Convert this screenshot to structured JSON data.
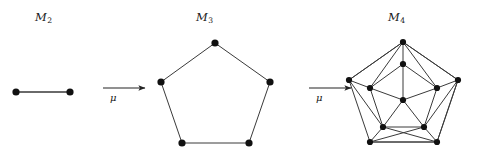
{
  "figure": {
    "background_color": "#ffffff",
    "stroke_color": "#3a3a3a",
    "vertex_color": "#111111",
    "width": 479,
    "height": 161,
    "labels": {
      "m2": {
        "base": "M",
        "sub": "2"
      },
      "m3": {
        "base": "M",
        "sub": "3"
      },
      "m4": {
        "base": "M",
        "sub": "4"
      }
    },
    "arrows": [
      {
        "name": "arrow-1",
        "label": "μ",
        "x1": 103,
        "y1": 88,
        "x2": 145,
        "y2": 88
      },
      {
        "name": "arrow-2",
        "label": "μ",
        "x1": 309,
        "y1": 88,
        "x2": 351,
        "y2": 88
      }
    ],
    "graphs": [
      {
        "id": "m2",
        "label_key": "m2",
        "vertex_count": 2,
        "edge_count": 1,
        "vertices": [
          {
            "id": 0,
            "x": 16,
            "y": 92
          },
          {
            "id": 1,
            "x": 70,
            "y": 92
          }
        ],
        "edges": [
          [
            0,
            1
          ]
        ]
      },
      {
        "id": "m3",
        "label_key": "m3",
        "vertex_count": 5,
        "edge_count": 5,
        "vertices": [
          {
            "id": 0,
            "x": 215,
            "y": 43
          },
          {
            "id": 1,
            "x": 270,
            "y": 82
          },
          {
            "id": 2,
            "x": 249,
            "y": 143
          },
          {
            "id": 3,
            "x": 182,
            "y": 143
          },
          {
            "id": 4,
            "x": 161,
            "y": 82
          }
        ],
        "edges": [
          [
            0,
            1
          ],
          [
            1,
            2
          ],
          [
            2,
            3
          ],
          [
            3,
            4
          ],
          [
            4,
            0
          ]
        ]
      },
      {
        "id": "m4",
        "label_key": "m4",
        "vertex_count": 11,
        "edge_count": 30,
        "vertices": [
          {
            "id": 0,
            "x": 403,
            "y": 42,
            "role": "outer"
          },
          {
            "id": 1,
            "x": 458,
            "y": 80,
            "role": "outer"
          },
          {
            "id": 2,
            "x": 437,
            "y": 142,
            "role": "outer"
          },
          {
            "id": 3,
            "x": 370,
            "y": 142,
            "role": "outer"
          },
          {
            "id": 4,
            "x": 349,
            "y": 80,
            "role": "outer"
          },
          {
            "id": 5,
            "x": 403,
            "y": 64,
            "role": "inner"
          },
          {
            "id": 6,
            "x": 437,
            "y": 88,
            "role": "inner"
          },
          {
            "id": 7,
            "x": 424,
            "y": 127,
            "role": "inner"
          },
          {
            "id": 8,
            "x": 383,
            "y": 127,
            "role": "inner"
          },
          {
            "id": 9,
            "x": 370,
            "y": 88,
            "role": "inner"
          },
          {
            "id": 10,
            "x": 403,
            "y": 100,
            "role": "center"
          }
        ],
        "edges": [
          [
            0,
            1
          ],
          [
            1,
            2
          ],
          [
            2,
            3
          ],
          [
            3,
            4
          ],
          [
            4,
            0
          ],
          [
            5,
            6
          ],
          [
            6,
            7
          ],
          [
            7,
            8
          ],
          [
            8,
            9
          ],
          [
            9,
            5
          ],
          [
            0,
            5
          ],
          [
            1,
            6
          ],
          [
            2,
            7
          ],
          [
            3,
            8
          ],
          [
            4,
            9
          ],
          [
            10,
            5
          ],
          [
            10,
            6
          ],
          [
            10,
            7
          ],
          [
            10,
            8
          ],
          [
            10,
            9
          ],
          [
            0,
            9
          ],
          [
            0,
            6
          ],
          [
            1,
            7
          ],
          [
            4,
            8
          ],
          [
            2,
            8
          ],
          [
            3,
            7
          ],
          [
            0,
            4
          ],
          [
            0,
            1
          ],
          [
            3,
            2
          ],
          [
            2,
            1
          ]
        ]
      }
    ]
  }
}
